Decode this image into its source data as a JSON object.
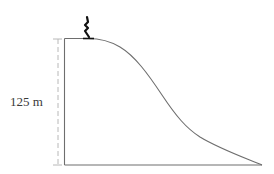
{
  "diagram": {
    "height_label": "125 m",
    "colors": {
      "hill_outline": "#6e6e6e",
      "dimension_line": "#b8b8b8",
      "figure": "#111111",
      "label": "#3a3a3a"
    },
    "icons": {
      "figure": "skier-icon"
    }
  }
}
